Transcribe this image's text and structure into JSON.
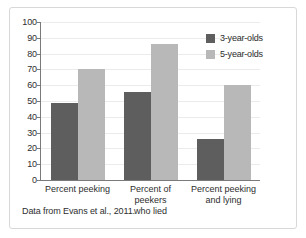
{
  "chart_data": {
    "type": "bar",
    "title": "",
    "xlabel": "",
    "ylabel": "",
    "ylim": [
      0,
      100
    ],
    "ytick_step": 10,
    "yticks": [
      100,
      90,
      80,
      70,
      60,
      50,
      40,
      30,
      20,
      10,
      0
    ],
    "grid": true,
    "legend_position": "top-right",
    "categories": [
      "Percent peeking",
      "Percent of peekers who lied",
      "Percent peeking and lying"
    ],
    "category_lines": [
      [
        "Percent peeking"
      ],
      [
        "Percent of peekers",
        "who lied"
      ],
      [
        "Percent peeking",
        "and lying"
      ]
    ],
    "series": [
      {
        "name": "3-year-olds",
        "color": "#5e5e5e",
        "values": [
          49,
          56,
          26
        ]
      },
      {
        "name": "5-year-olds",
        "color": "#b8b8b8",
        "values": [
          70,
          86,
          60
        ]
      }
    ]
  },
  "legend": {
    "items": [
      {
        "label": "3-year-olds",
        "color": "#5e5e5e"
      },
      {
        "label": "5-year-olds",
        "color": "#b8b8b8"
      }
    ]
  },
  "source_note": "Data from Evans et al., 2011."
}
